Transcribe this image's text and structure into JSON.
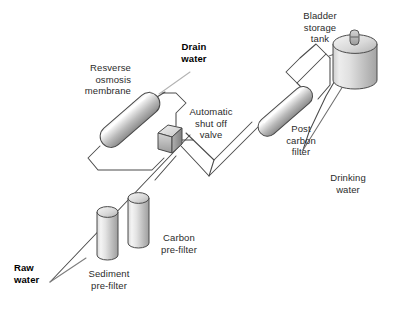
{
  "diagram": {
    "type": "schematic",
    "background_color": "#ffffff",
    "line_color": "#4a4a4a",
    "text_color": "#2b2b2b",
    "component_fill_light": "#ffffff",
    "component_fill_mid": "#c9c9c9",
    "component_fill_dark": "#8d8d8d"
  },
  "labels": {
    "raw_water": "Raw\nwater",
    "sediment_prefilter": "Sediment\npre-filter",
    "carbon_prefilter": "Carbon\npre-filter",
    "reverse_osmosis_membrane": "Resverse\nosmosis\nmembrane",
    "drain_water": "Drain\nwater",
    "automatic_shutoff_valve": "Automatic\nshut off\nvalve",
    "post_carbon_filter": "Post\ncarbon\nfilter",
    "bladder_storage_tank": "Bladder\nstorage\ntank",
    "drinking_water": "Drinking\nwater"
  },
  "components": [
    {
      "id": "sediment-prefilter",
      "name": "Sediment pre-filter",
      "shape": "vertical-cylinder"
    },
    {
      "id": "carbon-prefilter",
      "name": "Carbon pre-filter",
      "shape": "vertical-cylinder"
    },
    {
      "id": "ro-membrane",
      "name": "Resverse osmosis membrane",
      "shape": "angled-capsule"
    },
    {
      "id": "shutoff-valve",
      "name": "Automatic shut off valve",
      "shape": "cube"
    },
    {
      "id": "post-carbon-filter",
      "name": "Post carbon filter",
      "shape": "angled-capsule"
    },
    {
      "id": "bladder-tank",
      "name": "Bladder storage tank",
      "shape": "upright-cylinder"
    }
  ],
  "flow": [
    "Raw water",
    "Sediment pre-filter",
    "Carbon pre-filter",
    "Resverse osmosis membrane",
    "Automatic shut off valve",
    "Post carbon filter",
    "Bladder storage tank",
    "Drinking water"
  ],
  "bold_labels": [
    "Raw water",
    "Drain water"
  ]
}
